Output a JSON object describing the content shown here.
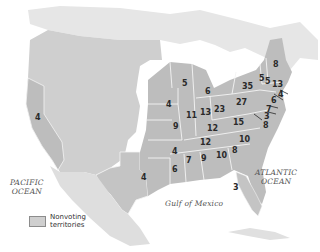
{
  "map": {
    "colors": {
      "land": "#d6d6d6",
      "states": "#bdbdbd",
      "territories": "#cfcfcf",
      "border": "#f4f4f4",
      "water": "#ffffff",
      "label": "#2a2a2a"
    },
    "water_labels": {
      "pacific_line1": "PACIFIC",
      "pacific_line2": "OCEAN",
      "atlantic_line1": "ATLANTIC",
      "atlantic_line2": "OCEAN",
      "gulf": "Gulf of Mexico"
    },
    "legend": {
      "label_line1": "Nonvoting",
      "label_line2": "territories"
    },
    "state_votes": [
      {
        "region": "california",
        "value": "4"
      },
      {
        "region": "texas",
        "value": "4"
      },
      {
        "region": "wisconsin",
        "value": "5"
      },
      {
        "region": "michigan",
        "value": "6"
      },
      {
        "region": "iowa",
        "value": "4"
      },
      {
        "region": "illinois",
        "value": "11"
      },
      {
        "region": "indiana",
        "value": "13"
      },
      {
        "region": "ohio",
        "value": "23"
      },
      {
        "region": "pennsylvania",
        "value": "27"
      },
      {
        "region": "new-york",
        "value": "35"
      },
      {
        "region": "vermont",
        "value": "5"
      },
      {
        "region": "new-hampshire",
        "value": "5"
      },
      {
        "region": "maine",
        "value": "8"
      },
      {
        "region": "massachusetts",
        "value": "13"
      },
      {
        "region": "rhode-island",
        "value": "4"
      },
      {
        "region": "connecticut",
        "value": "6"
      },
      {
        "region": "new-jersey",
        "value": "7"
      },
      {
        "region": "delaware",
        "value": "3"
      },
      {
        "region": "maryland",
        "value": "8"
      },
      {
        "region": "missouri",
        "value": "9"
      },
      {
        "region": "kentucky",
        "value": "12"
      },
      {
        "region": "virginia",
        "value": "15"
      },
      {
        "region": "tennessee",
        "value": "12"
      },
      {
        "region": "north-carolina",
        "value": "10"
      },
      {
        "region": "south-carolina",
        "value": "8"
      },
      {
        "region": "arkansas",
        "value": "4"
      },
      {
        "region": "mississippi",
        "value": "7"
      },
      {
        "region": "alabama",
        "value": "9"
      },
      {
        "region": "georgia",
        "value": "10"
      },
      {
        "region": "louisiana",
        "value": "6"
      },
      {
        "region": "florida",
        "value": "3"
      }
    ]
  }
}
